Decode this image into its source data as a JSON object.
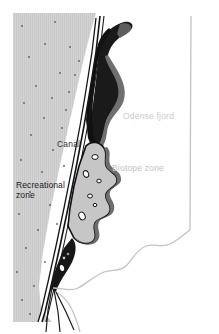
{
  "map": {
    "title": "Odense fjord canal and zones map",
    "labels": {
      "fjord": "Odense fjord",
      "biotope": "Biotope zone",
      "canal": "Canal",
      "recreational": "Recreational\nzone"
    },
    "colors": {
      "background": "#ffffff",
      "recreational_fill": "#d2d2d2",
      "recreational_hatch": "#c4c4c4",
      "recreational_dot": "#595959",
      "water_dark": "#141414",
      "shore_band": "#7a7a7a",
      "biotope_fill": "#c6c6c6",
      "biotope_edge": "#111111",
      "coastline": "#c0c0c0",
      "canal_white": "#ffffff",
      "label_light": "#c9c9c9",
      "label_dark": "#181818"
    },
    "features": [
      "recreational-zone-hatched-area",
      "canal-white-channel",
      "fjord-water-dark-body",
      "biotope-zone-blob",
      "biotope-ponds",
      "fjord-coastline",
      "right-boundary-line"
    ]
  }
}
